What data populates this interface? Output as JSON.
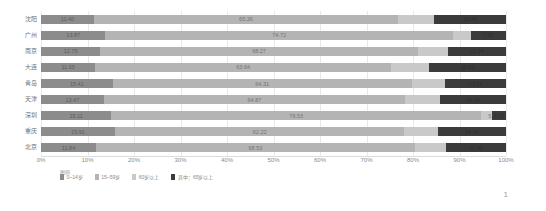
{
  "chart_data": {
    "type": "bar",
    "orientation": "horizontal",
    "stacked": true,
    "normalized_percent": true,
    "title": "",
    "xlabel": "",
    "ylabel": "",
    "xlim": [
      0,
      100
    ],
    "grid": true,
    "legend_position": "bottom-left",
    "legend_title": "图例",
    "xtick_labels": [
      "0%",
      "10%",
      "20%",
      "30%",
      "40%",
      "50%",
      "60%",
      "70%",
      "80%",
      "90%",
      "100%"
    ],
    "xticks": [
      0,
      10,
      20,
      30,
      40,
      50,
      60,
      70,
      80,
      90,
      100
    ],
    "categories": [
      "沈阳",
      "广州",
      "南京",
      "大连",
      "青岛",
      "天津",
      "深圳",
      "重庆",
      "北京"
    ],
    "series": [
      {
        "name": "0~14岁",
        "color": "#8c8c8c",
        "values": [
          11.4,
          13.87,
          12.75,
          11.65,
          15.41,
          13.47,
          15.11,
          15.91,
          11.84
        ]
      },
      {
        "name": "15~59岁",
        "color": "#b4b4b4",
        "values": [
          65.36,
          74.72,
          68.27,
          63.64,
          64.31,
          64.87,
          79.53,
          62.22,
          68.53
        ]
      },
      {
        "name": "60岁以上",
        "color": "#c9c9c9",
        "values": [
          23.24,
          11.41,
          18.98,
          24.71,
          20.28,
          21.66,
          5.36,
          21.87,
          19.63
        ]
      },
      {
        "name": "其中：65岁以上",
        "color": "#3b3b3b",
        "values": [
          15.4,
          7.58,
          12.54,
          16.52,
          13.11,
          14.24,
          3.12,
          14.66,
          12.95
        ]
      }
    ]
  },
  "footer": {
    "page_number": "1"
  }
}
